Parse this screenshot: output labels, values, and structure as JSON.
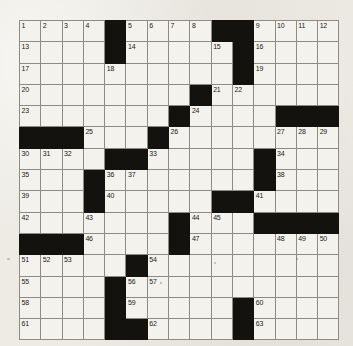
{
  "puzzle": {
    "title": "Crossword Grid",
    "rows": 14,
    "cols": 15,
    "colors": {
      "paper": "#edebe4",
      "cell_white": "#f4f2ed",
      "cell_black": "#14120f",
      "grid_line": "#8d8b86",
      "border": "#6c6a66",
      "number_text": "#1b1a18"
    },
    "legend": {
      "white_code": 0,
      "black_code": 1
    },
    "grid": [
      [
        0,
        0,
        0,
        0,
        1,
        0,
        0,
        0,
        0,
        1,
        1,
        0,
        0,
        0,
        0
      ],
      [
        0,
        0,
        0,
        0,
        1,
        0,
        0,
        0,
        0,
        0,
        1,
        0,
        0,
        0,
        0
      ],
      [
        0,
        0,
        0,
        0,
        0,
        0,
        0,
        0,
        0,
        0,
        1,
        0,
        0,
        0,
        0
      ],
      [
        0,
        0,
        0,
        0,
        0,
        0,
        0,
        0,
        1,
        0,
        0,
        0,
        0,
        0,
        0
      ],
      [
        0,
        0,
        0,
        0,
        0,
        0,
        0,
        1,
        0,
        0,
        0,
        0,
        1,
        1,
        1
      ],
      [
        1,
        1,
        1,
        0,
        0,
        0,
        1,
        0,
        0,
        0,
        0,
        0,
        0,
        0,
        0
      ],
      [
        0,
        0,
        0,
        0,
        1,
        1,
        0,
        0,
        0,
        0,
        0,
        1,
        0,
        0,
        0
      ],
      [
        0,
        0,
        0,
        1,
        0,
        0,
        0,
        0,
        0,
        0,
        0,
        1,
        0,
        0,
        0
      ],
      [
        0,
        0,
        0,
        1,
        0,
        0,
        0,
        0,
        0,
        1,
        1,
        0,
        0,
        0,
        0
      ],
      [
        0,
        0,
        0,
        0,
        0,
        0,
        0,
        1,
        0,
        0,
        0,
        1,
        1,
        1,
        1
      ],
      [
        1,
        1,
        1,
        0,
        0,
        0,
        0,
        1,
        0,
        0,
        0,
        0,
        0,
        0,
        0
      ],
      [
        0,
        0,
        0,
        0,
        0,
        1,
        0,
        0,
        0,
        0,
        0,
        0,
        0,
        0,
        0
      ],
      [
        0,
        0,
        0,
        0,
        1,
        0,
        0,
        0,
        0,
        0,
        0,
        0,
        0,
        0,
        0
      ],
      [
        0,
        0,
        0,
        0,
        1,
        0,
        0,
        0,
        0,
        0,
        1,
        0,
        0,
        0,
        0
      ],
      [
        0,
        0,
        0,
        0,
        1,
        1,
        0,
        0,
        0,
        0,
        1,
        0,
        0,
        0,
        0
      ]
    ],
    "numbers": [
      {
        "row": 0,
        "col": 0,
        "n": "1"
      },
      {
        "row": 0,
        "col": 1,
        "n": "2"
      },
      {
        "row": 0,
        "col": 2,
        "n": "3"
      },
      {
        "row": 0,
        "col": 3,
        "n": "4"
      },
      {
        "row": 0,
        "col": 5,
        "n": "5"
      },
      {
        "row": 0,
        "col": 6,
        "n": "6"
      },
      {
        "row": 0,
        "col": 7,
        "n": "7"
      },
      {
        "row": 0,
        "col": 8,
        "n": "8"
      },
      {
        "row": 0,
        "col": 11,
        "n": "9"
      },
      {
        "row": 0,
        "col": 12,
        "n": "10"
      },
      {
        "row": 0,
        "col": 13,
        "n": "11"
      },
      {
        "row": 0,
        "col": 14,
        "n": "12"
      },
      {
        "row": 1,
        "col": 0,
        "n": "13"
      },
      {
        "row": 1,
        "col": 5,
        "n": "14"
      },
      {
        "row": 1,
        "col": 9,
        "n": "15"
      },
      {
        "row": 1,
        "col": 11,
        "n": "16"
      },
      {
        "row": 2,
        "col": 0,
        "n": "17"
      },
      {
        "row": 2,
        "col": 4,
        "n": "18"
      },
      {
        "row": 2,
        "col": 11,
        "n": "19"
      },
      {
        "row": 3,
        "col": 0,
        "n": "20"
      },
      {
        "row": 3,
        "col": 9,
        "n": "21"
      },
      {
        "row": 3,
        "col": 10,
        "n": "22"
      },
      {
        "row": 4,
        "col": 0,
        "n": "23"
      },
      {
        "row": 4,
        "col": 8,
        "n": "24"
      },
      {
        "row": 5,
        "col": 3,
        "n": "25"
      },
      {
        "row": 5,
        "col": 7,
        "n": "26"
      },
      {
        "row": 5,
        "col": 12,
        "n": "27"
      },
      {
        "row": 5,
        "col": 13,
        "n": "28"
      },
      {
        "row": 5,
        "col": 14,
        "n": "29"
      },
      {
        "row": 6,
        "col": 0,
        "n": "30"
      },
      {
        "row": 6,
        "col": 1,
        "n": "31"
      },
      {
        "row": 6,
        "col": 2,
        "n": "32"
      },
      {
        "row": 6,
        "col": 6,
        "n": "33"
      },
      {
        "row": 6,
        "col": 12,
        "n": "34"
      },
      {
        "row": 7,
        "col": 0,
        "n": "35"
      },
      {
        "row": 7,
        "col": 4,
        "n": "36"
      },
      {
        "row": 7,
        "col": 5,
        "n": "37"
      },
      {
        "row": 7,
        "col": 12,
        "n": "38"
      },
      {
        "row": 8,
        "col": 0,
        "n": "39"
      },
      {
        "row": 8,
        "col": 4,
        "n": "40"
      },
      {
        "row": 8,
        "col": 11,
        "n": "41"
      },
      {
        "row": 9,
        "col": 0,
        "n": "42"
      },
      {
        "row": 9,
        "col": 3,
        "n": "43"
      },
      {
        "row": 9,
        "col": 8,
        "n": "44"
      },
      {
        "row": 9,
        "col": 9,
        "n": "45"
      },
      {
        "row": 10,
        "col": 3,
        "n": "46"
      },
      {
        "row": 10,
        "col": 8,
        "n": "47"
      },
      {
        "row": 10,
        "col": 12,
        "n": "48"
      },
      {
        "row": 10,
        "col": 13,
        "n": "49"
      },
      {
        "row": 10,
        "col": 14,
        "n": "50"
      },
      {
        "row": 11,
        "col": 0,
        "n": "51"
      },
      {
        "row": 11,
        "col": 1,
        "n": "52"
      },
      {
        "row": 11,
        "col": 2,
        "n": "53"
      },
      {
        "row": 11,
        "col": 6,
        "n": "54"
      },
      {
        "row": 12,
        "col": 0,
        "n": "55"
      },
      {
        "row": 12,
        "col": 5,
        "n": "56"
      },
      {
        "row": 12,
        "col": 6,
        "n": "57"
      },
      {
        "row": 13,
        "col": 0,
        "n": "58"
      },
      {
        "row": 13,
        "col": 5,
        "n": "59"
      },
      {
        "row": 13,
        "col": 11,
        "n": "60"
      },
      {
        "row": 14,
        "col": 0,
        "n": "61"
      },
      {
        "row": 14,
        "col": 6,
        "n": "62"
      },
      {
        "row": 14,
        "col": 11,
        "n": "63"
      }
    ]
  }
}
